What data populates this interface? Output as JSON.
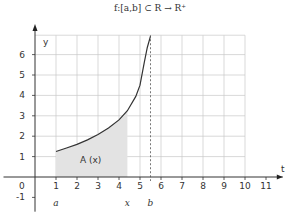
{
  "chart_data": {
    "type": "line",
    "title": "f:[a,b] ⊂ R → R⁺",
    "xlabel": "t",
    "ylabel": "y",
    "xlim": [
      -1,
      11.5
    ],
    "ylim": [
      -1,
      7
    ],
    "grid": true,
    "x_ticks": [
      "0",
      "1",
      "2",
      "3",
      "4",
      "5",
      "6",
      "7",
      "8",
      "9",
      "10",
      "11"
    ],
    "y_ticks": [
      "-1",
      "1",
      "2",
      "3",
      "4",
      "5",
      "6"
    ],
    "series": [
      {
        "name": "f(t)",
        "x": [
          1,
          1.5,
          2,
          2.5,
          3,
          3.5,
          4,
          4.4,
          4.8,
          5.0,
          5.2,
          5.35,
          5.5
        ],
        "y": [
          1.25,
          1.42,
          1.6,
          1.82,
          2.08,
          2.4,
          2.8,
          3.25,
          3.95,
          4.5,
          5.6,
          6.35,
          6.9
        ]
      }
    ],
    "shaded_area": {
      "label": "A (x)",
      "from": 1,
      "to": 4.4,
      "color": "#e3e3e3"
    },
    "annotations": [
      {
        "text": "a",
        "x": 1
      },
      {
        "text": "x",
        "x": 4.4
      },
      {
        "text": "b",
        "x": 5.5
      }
    ],
    "dashed_line_x": 5.5
  },
  "labels": {
    "title": "f:[a,b] ⊂ R → R⁺",
    "y_axis": "y",
    "t_axis": "t",
    "area": "A (x)",
    "a": "a",
    "x": "x",
    "b": "b"
  }
}
